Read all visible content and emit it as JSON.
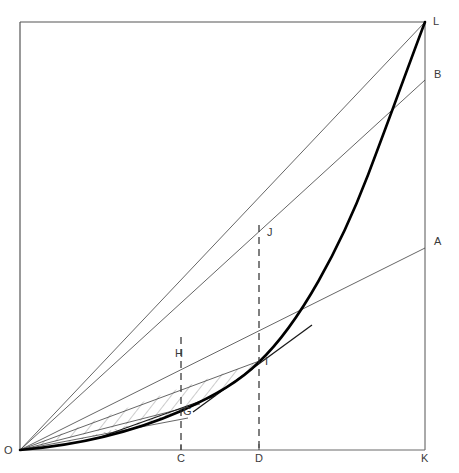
{
  "figure": {
    "kind": "geometric-diagram",
    "background_color": "#ffffff",
    "frame_color": "#555555",
    "thin_line_color": "#444444",
    "curve_color": "#000000",
    "hatch_color": "#9a9a9a",
    "label_color": "#3a3a3a"
  },
  "frame": {
    "left": 20,
    "right": 425,
    "top": 22,
    "bottom": 450
  },
  "labels": [
    {
      "id": "L",
      "text": "L",
      "x": 433,
      "y": 16,
      "role": "upper-right-corner-point"
    },
    {
      "id": "B",
      "text": "B",
      "x": 434,
      "y": 69,
      "role": "right-edge-point"
    },
    {
      "id": "A",
      "text": "A",
      "x": 434,
      "y": 236,
      "role": "right-edge-point"
    },
    {
      "id": "J",
      "text": "J",
      "x": 267,
      "y": 227,
      "role": "ordinate-top-point"
    },
    {
      "id": "H",
      "text": "H",
      "x": 175,
      "y": 348,
      "role": "ordinate-point"
    },
    {
      "id": "I",
      "text": "I",
      "x": 265,
      "y": 356,
      "role": "curve-point"
    },
    {
      "id": "G",
      "text": "G",
      "x": 183,
      "y": 406,
      "role": "curve-point"
    },
    {
      "id": "O",
      "text": "O",
      "x": 4,
      "y": 445,
      "role": "origin"
    },
    {
      "id": "C",
      "text": "C",
      "x": 177,
      "y": 450,
      "role": "axis-tick-label"
    },
    {
      "id": "D",
      "text": "D",
      "x": 255,
      "y": 450,
      "role": "axis-tick-label"
    },
    {
      "id": "K",
      "text": "K",
      "x": 421,
      "y": 450,
      "role": "lower-right-corner-point"
    }
  ],
  "points": {
    "O": {
      "x": 20,
      "y": 450
    },
    "K": {
      "x": 425,
      "y": 450
    },
    "L": {
      "x": 425,
      "y": 22
    },
    "A": {
      "x": 425,
      "y": 248
    },
    "B": {
      "x": 425,
      "y": 80
    },
    "C": {
      "x": 181,
      "y": 450
    },
    "D": {
      "x": 259,
      "y": 450
    },
    "G": {
      "x": 181,
      "y": 411
    },
    "H": {
      "x": 181,
      "y": 359
    },
    "I": {
      "x": 259,
      "y": 362
    },
    "J": {
      "x": 259,
      "y": 226
    }
  },
  "curve": {
    "name": "main-convex-curve",
    "from": "O",
    "to": "L",
    "passes_through": [
      "G",
      "I"
    ],
    "stroke_width": 2.6
  },
  "chords_from_origin": [
    {
      "name": "chord-O-A",
      "to": "A",
      "stroke_width": 0.8
    },
    {
      "name": "chord-O-B",
      "to": "B",
      "stroke_width": 0.8
    },
    {
      "name": "chord-O-L",
      "to": "L",
      "stroke_width": 0.8
    },
    {
      "name": "chord-O-I",
      "to": "I",
      "stroke_width": 0.8
    },
    {
      "name": "chord-O-G",
      "to": "G",
      "stroke_width": 0.8
    },
    {
      "name": "chord-O-lower",
      "to": "lower",
      "stroke_width": 0.8
    }
  ],
  "ordinates": [
    {
      "name": "ordinate-C-J-dashed",
      "x": 181,
      "y_top": 337,
      "y_bottom": 450,
      "dash": "7 5"
    },
    {
      "name": "ordinate-D-J-dashed",
      "x": 259,
      "y_top": 225,
      "y_bottom": 450,
      "dash": "7 5"
    }
  ],
  "tangents": [
    {
      "name": "tangent-at-I",
      "x1": 193,
      "y1": 412,
      "x2": 312,
      "y2": 325
    },
    {
      "name": "tangent-at-G",
      "x1": 95,
      "y1": 439,
      "x2": 215,
      "y2": 396
    }
  ],
  "hatched_regions": [
    {
      "name": "upper-hatched-lune",
      "pattern": "diagonal",
      "between": [
        "chord-O-I",
        "curve O..I"
      ]
    },
    {
      "name": "lower-crosshatched-lune",
      "pattern": "cross",
      "between": [
        "chord-O-G-extended",
        "curve O..G"
      ]
    }
  ],
  "axis_ticks": [
    {
      "name": "tick-C",
      "x": 181
    },
    {
      "name": "tick-D",
      "x": 259
    }
  ]
}
